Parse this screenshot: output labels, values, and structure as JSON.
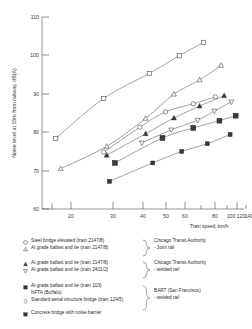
{
  "chart_data": {
    "type": "line",
    "title": "",
    "xlabel": "Train speed, km/h",
    "ylabel": "Noise level at 15m from railway, dB(A)",
    "xscale": "log",
    "xlim": [
      15,
      155
    ],
    "ylim": [
      60,
      110
    ],
    "xticks": [
      20,
      30,
      40,
      50,
      60,
      80,
      100,
      120,
      140
    ],
    "xtick_labels": [
      "20",
      "30",
      "40",
      "50",
      "60",
      "80",
      "100",
      "120",
      "140"
    ],
    "xminor_ticks": [
      15,
      70,
      90,
      110,
      130,
      150
    ],
    "yticks": [
      60,
      70,
      80,
      90,
      100,
      110
    ],
    "ytick_labels": [
      "60",
      "70",
      "80",
      "90",
      "100",
      "110"
    ],
    "grid": false,
    "legend_position": "below-plot",
    "series": [
      {
        "name": "Steel bridge elevated (train 2147/8)",
        "marker": "open-square",
        "points": [
          {
            "x": 17.5,
            "y": 78.4
          },
          {
            "x": 30.0,
            "y": 88.8
          },
          {
            "x": 50.0,
            "y": 95.3
          },
          {
            "x": 70.0,
            "y": 99.9
          },
          {
            "x": 92.0,
            "y": 103.4
          }
        ]
      },
      {
        "name": "At grade ballast and tie (train 2147/8)",
        "marker": "open-triangle-up",
        "points": [
          {
            "x": 18.5,
            "y": 70.5
          },
          {
            "x": 31.0,
            "y": 76.3
          },
          {
            "x": 48.0,
            "y": 83.6
          },
          {
            "x": 66.0,
            "y": 89.9
          },
          {
            "x": 88.0,
            "y": 93.6
          },
          {
            "x": 112.0,
            "y": 97.4
          }
        ]
      },
      {
        "name": "At grade ballast and tie (train 2147/8)",
        "marker": "filled-triangle-up",
        "points": [
          {
            "x": 31.0,
            "y": 74.0
          },
          {
            "x": 48.0,
            "y": 79.6
          },
          {
            "x": 66.0,
            "y": 83.7
          },
          {
            "x": 88.0,
            "y": 86.8
          },
          {
            "x": 116.0,
            "y": 89.5
          }
        ]
      },
      {
        "name": "At grade ballast and tie (train 2401/2)",
        "marker": "open-triangle-down",
        "points": [
          {
            "x": 46.0,
            "y": 77.2
          },
          {
            "x": 64.0,
            "y": 80.6
          },
          {
            "x": 86.0,
            "y": 83.1
          },
          {
            "x": 104.0,
            "y": 85.5
          },
          {
            "x": 126.0,
            "y": 87.9
          }
        ]
      },
      {
        "name": "At grade ballast and tie (train 103) NFTA (Buffalo)",
        "marker": "filled-square",
        "points": [
          {
            "x": 34.0,
            "y": 72.0
          },
          {
            "x": 58.0,
            "y": 78.5
          },
          {
            "x": 82.0,
            "y": 81.1
          },
          {
            "x": 110.0,
            "y": 83.0
          },
          {
            "x": 132.0,
            "y": 84.3
          }
        ]
      },
      {
        "name": "Standard aerial structure bridge (train 124/5)",
        "marker": "open-circle",
        "points": [
          {
            "x": 30.0,
            "y": 74.8
          },
          {
            "x": 45.0,
            "y": 81.3
          },
          {
            "x": 60.0,
            "y": 85.3
          },
          {
            "x": 82.0,
            "y": 87.4
          },
          {
            "x": 105.0,
            "y": 89.2
          }
        ]
      },
      {
        "name": "Concrete bridge with noise barrier",
        "marker": "filled-square-small",
        "points": [
          {
            "x": 32.0,
            "y": 67.2
          },
          {
            "x": 52.0,
            "y": 72.0
          },
          {
            "x": 72.0,
            "y": 75.0
          },
          {
            "x": 96.0,
            "y": 77.0
          },
          {
            "x": 124.0,
            "y": 79.4
          }
        ]
      }
    ],
    "legend_entries": [
      {
        "marker": "open-circle",
        "label": "Steel bridge elevated (train 2147/8)"
      },
      {
        "marker": "open-triangle-up",
        "label": "At grade ballast and tie (train 2147/8)"
      },
      {
        "marker": "filled-triangle-up",
        "label": "At grade ballast and tie (train 2147/8)"
      },
      {
        "marker": "open-triangle-down",
        "label": "At grade ballast and tie (train 2401/2)"
      },
      {
        "marker": "filled-square",
        "label": "At grade ballast and tie (train 103)"
      },
      {
        "marker": "none",
        "label": "NFTA (Buffalo)"
      },
      {
        "marker": "open-circle-thin",
        "label": "Standard aerial structure bridge (train 124/5)"
      },
      {
        "marker": "filled-square",
        "label": "Concrete bridge with noise barrier"
      }
    ],
    "legend_groups": [
      {
        "line1": "Chicago Transit Authority",
        "line2": "- Joint rail"
      },
      {
        "line1": "Chicago Transit Authority",
        "line2": "- welded rail"
      },
      {
        "line1": "BART (San Francisco)",
        "line2": "- welded rail"
      }
    ]
  }
}
